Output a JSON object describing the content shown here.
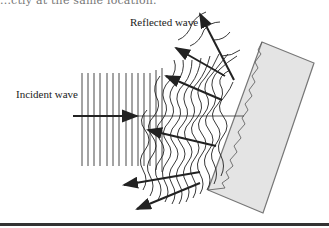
{
  "figure": {
    "top_text_fragment": "...ctly at the same location.",
    "labels": {
      "incident": "Incident wave",
      "reflected": "Reflected wave"
    },
    "colors": {
      "ink": "#222222",
      "slab_fill": "#e4e4e4",
      "slab_edge": "#777777",
      "rule": "#333333"
    },
    "incident_wavefronts": {
      "count": 14,
      "x_start": 82,
      "x_spacing": 6,
      "y_top": 73,
      "y_bottom": 166
    },
    "incident_arrow": {
      "x1": 73,
      "y1": 116,
      "x2": 137,
      "y2": 116
    },
    "reflected_arrows": [
      {
        "x1": 234,
        "y1": 80,
        "x2": 200,
        "y2": 14
      },
      {
        "x1": 225,
        "y1": 76,
        "x2": 176,
        "y2": 48
      },
      {
        "x1": 222,
        "y1": 100,
        "x2": 166,
        "y2": 76
      },
      {
        "x1": 216,
        "y1": 146,
        "x2": 148,
        "y2": 130
      },
      {
        "x1": 200,
        "y1": 172,
        "x2": 124,
        "y2": 185
      },
      {
        "x1": 200,
        "y1": 183,
        "x2": 137,
        "y2": 209
      }
    ],
    "slab_polygon": "262,42 314,63 263,213 208,190"
  }
}
